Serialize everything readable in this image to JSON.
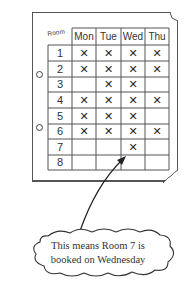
{
  "grid": {
    "corner_label": "Room",
    "columns": [
      "Mon",
      "Tue",
      "Wed",
      "Thu"
    ],
    "rows": [
      {
        "room": "1",
        "bookings": [
          true,
          true,
          true,
          true
        ]
      },
      {
        "room": "2",
        "bookings": [
          true,
          true,
          true,
          true
        ]
      },
      {
        "room": "3",
        "bookings": [
          false,
          true,
          true,
          false
        ]
      },
      {
        "room": "4",
        "bookings": [
          true,
          true,
          true,
          true
        ]
      },
      {
        "room": "5",
        "bookings": [
          true,
          true,
          true,
          false
        ]
      },
      {
        "room": "6",
        "bookings": [
          true,
          true,
          true,
          true
        ]
      },
      {
        "room": "7",
        "bookings": [
          false,
          false,
          true,
          false
        ]
      },
      {
        "room": "8",
        "bookings": [
          false,
          false,
          false,
          false
        ]
      }
    ],
    "mark_symbol": "✕"
  },
  "callout": {
    "line1": "This means Room 7 is",
    "line2": "booked on Wednesday",
    "points_to": {
      "room": "7",
      "day": "Wed"
    }
  },
  "colors": {
    "line": "#555555",
    "text": "#333333"
  }
}
